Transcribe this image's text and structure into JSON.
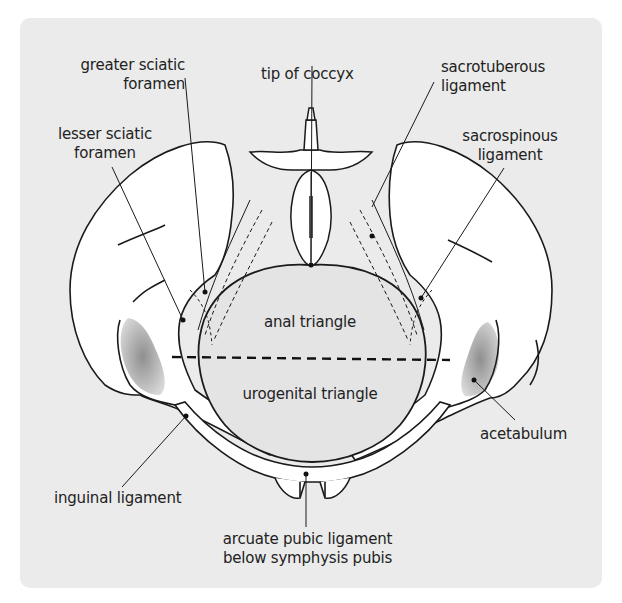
{
  "figure": {
    "background_color": "#ebebeb",
    "bone_fill": "#ffffff",
    "outline_color": "#1a1a1a",
    "acetabulum_shade": "#9a9a9a"
  },
  "labels": {
    "greater_sciatic_foramen": {
      "line1": "greater sciatic",
      "line2": "foramen"
    },
    "tip_of_coccyx": {
      "line1": "tip of coccyx"
    },
    "sacrotuberous_ligament": {
      "line1": "sacrotuberous",
      "line2": "ligament"
    },
    "lesser_sciatic_foramen": {
      "line1": "lesser sciatic",
      "line2": "foramen"
    },
    "sacrospinous_ligament": {
      "line1": "sacrospinous",
      "line2": "ligament"
    },
    "anal_triangle": {
      "line1": "anal triangle"
    },
    "urogenital_triangle": {
      "line1": "urogenital triangle"
    },
    "acetabulum": {
      "line1": "acetabulum"
    },
    "inguinal_ligament": {
      "line1": "inguinal ligament"
    },
    "arcuate_pubic_ligament": {
      "line1": "arcuate pubic ligament",
      "line2": "below symphysis pubis"
    }
  },
  "dividing_line": {
    "style": "dashed",
    "meaning": "separates anal triangle from urogenital triangle"
  }
}
